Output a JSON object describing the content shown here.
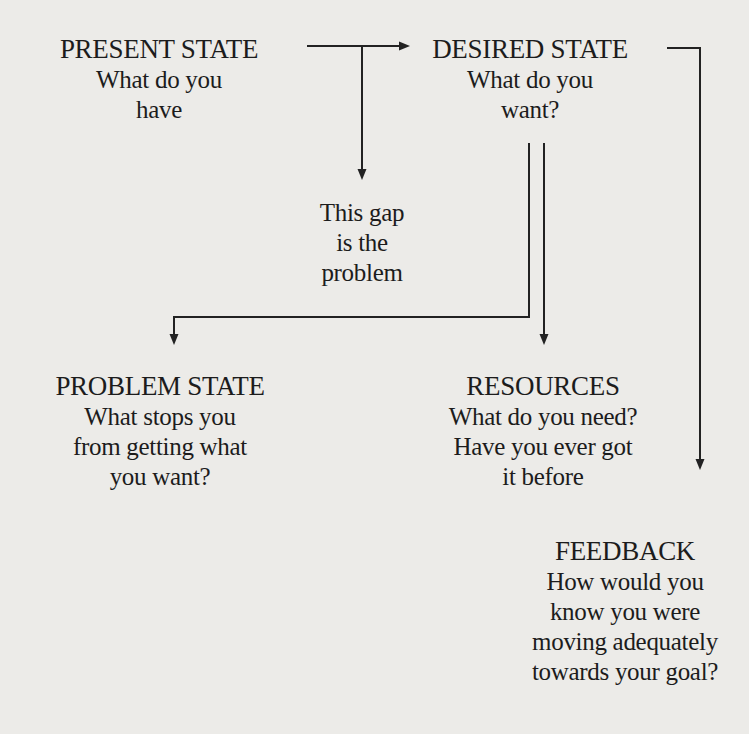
{
  "diagram": {
    "nodes": {
      "present_state": {
        "title": "PRESENT STATE",
        "lines": [
          "What do you",
          "have"
        ]
      },
      "desired_state": {
        "title": "DESIRED STATE",
        "lines": [
          "What do you",
          "want?"
        ]
      },
      "gap": {
        "lines": [
          "This gap",
          "is the",
          "problem"
        ]
      },
      "problem_state": {
        "title": "PROBLEM STATE",
        "lines": [
          "What stops you",
          "from getting what",
          "you want?"
        ]
      },
      "resources": {
        "title": "RESOURCES",
        "lines": [
          "What do you need?",
          "Have you ever got",
          "it before"
        ]
      },
      "feedback": {
        "title": "FEEDBACK",
        "lines": [
          "How would you",
          "know you were",
          "moving adequately",
          "towards your goal?"
        ]
      }
    },
    "edges": [
      {
        "from": "present_state",
        "to": "desired_state"
      },
      {
        "from": "present_state-desired_state",
        "to": "gap"
      },
      {
        "from": "desired_state",
        "to": "problem_state"
      },
      {
        "from": "desired_state",
        "to": "resources"
      },
      {
        "from": "desired_state",
        "to": "feedback"
      }
    ]
  }
}
